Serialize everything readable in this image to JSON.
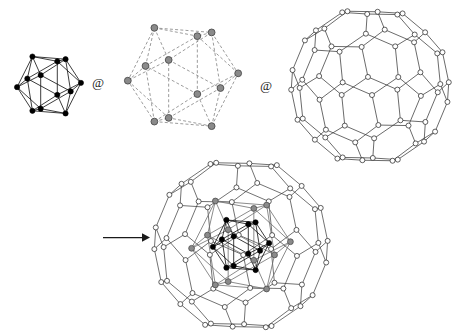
{
  "figure": {
    "domain": "chemical-structure-diagram",
    "background_color": "#ffffff",
    "operators": [
      {
        "name": "at-operator-1",
        "symbol": "@",
        "x": 95,
        "y": 83
      },
      {
        "name": "at-operator-2",
        "symbol": "@",
        "x": 263,
        "y": 86
      }
    ],
    "arrow": {
      "name": "yields-arrow",
      "x1": 103,
      "y1": 237,
      "x2": 147,
      "y2": 237,
      "color": "#1a1a1a"
    }
  },
  "palette": {
    "black_vertex_fill": "#000000",
    "black_vertex_stroke": "#000000",
    "gray_vertex_fill": "#8a8a8a",
    "gray_vertex_stroke": "#4d4d4d",
    "white_vertex_fill": "#ffffff",
    "white_vertex_stroke": "#2b2b2b",
    "edge_black": "#1a1a1a",
    "edge_gray": "#8a8a8a",
    "edge_cage": "#3a3a3a"
  },
  "panels": [
    {
      "name": "icosahedron-black",
      "label": "M12 icosahedral core",
      "vertex_count": 12,
      "edge_count": 30,
      "vertex_style": "filled-black",
      "edge_style": "solid",
      "center": {
        "x": 48,
        "y": 84
      },
      "radius": 33
    },
    {
      "name": "icosahedron-gray",
      "label": "Outer icosahedral shell",
      "vertex_count": 12,
      "edge_count": 30,
      "vertex_style": "filled-gray",
      "edge_style": "dashed",
      "center": {
        "x": 182,
        "y": 76
      },
      "radius": 57
    },
    {
      "name": "fullerene-cage",
      "label": "C60 fullerene cage",
      "vertex_count": 60,
      "edge_count": 90,
      "vertex_style": "open-circle",
      "edge_style": "solid",
      "center": {
        "x": 370,
        "y": 84
      },
      "radius": 80
    },
    {
      "name": "composite-structure",
      "label": "Icosahedron @ icosahedron @ fullerene",
      "vertex_style": "mixed",
      "edge_style": "solid",
      "center": {
        "x": 240,
        "y": 245
      },
      "radius": 88,
      "layers": [
        "fullerene-cage",
        "icosahedron-gray",
        "icosahedron-black"
      ]
    }
  ],
  "chart_data": {
    "type": "diagram",
    "note": "Three source polyhedra combined with @ operators yield an onion-like endohedral structure",
    "series": [
      {
        "name": "core icosahedron",
        "vertices": 12,
        "edges": 30,
        "color": "#000000"
      },
      {
        "name": "shell icosahedron",
        "vertices": 12,
        "edges": 30,
        "color": "#8a8a8a"
      },
      {
        "name": "C60 cage",
        "vertices": 60,
        "edges": 90,
        "color": "#ffffff"
      }
    ]
  }
}
